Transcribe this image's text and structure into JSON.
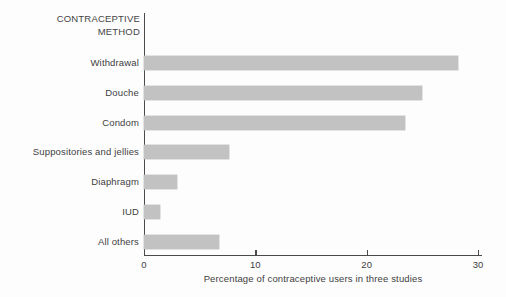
{
  "chart_data": {
    "type": "bar",
    "orientation": "horizontal",
    "title": "",
    "category_axis_title": "CONTRACEPTIVE\nMETHOD",
    "xlabel": "Percentage of contraceptive users in three studies",
    "ylabel": "",
    "categories": [
      "Withdrawal",
      "Douche",
      "Condom",
      "Suppositories and jellies",
      "Diaphragm",
      "IUD",
      "All others"
    ],
    "values": [
      28.2,
      25.0,
      23.4,
      7.6,
      3.0,
      1.4,
      6.7
    ],
    "xlim": [
      0,
      30
    ],
    "xticks": [
      0,
      10,
      20,
      30
    ],
    "xtick_labels": [
      "0",
      "10",
      "20",
      "30"
    ],
    "grid": false,
    "legend": false,
    "bar_color": "#c2c2c2",
    "axis_color": "#4a4a4a",
    "background_color": "#fdfdfd"
  }
}
